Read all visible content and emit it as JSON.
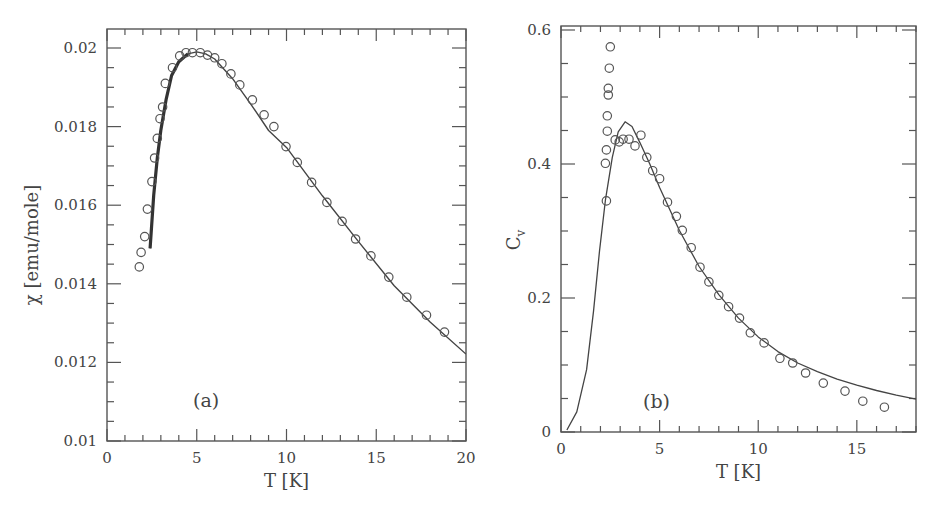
{
  "chart_data": [
    {
      "type": "scatter",
      "panel_label": "(a)",
      "xlabel": "T [K]",
      "ylabel": "χ [emu/mole]",
      "xlim": [
        0,
        20
      ],
      "ylim": [
        0.01,
        0.0205
      ],
      "xticks": [
        0,
        5,
        10,
        15,
        20
      ],
      "xtick_labels": [
        "0",
        "5",
        "10",
        "15",
        "20"
      ],
      "yticks": [
        0.01,
        0.012,
        0.014,
        0.016,
        0.018,
        0.02
      ],
      "ytick_labels": [
        "0.01",
        "0.012",
        "0.014",
        "0.016",
        "0.018",
        "0.02"
      ],
      "grid": false,
      "series": [
        {
          "name": "experiment",
          "style": "open-circle",
          "x": [
            1.8,
            1.9,
            2.1,
            2.25,
            2.5,
            2.65,
            2.8,
            2.95,
            3.1,
            3.25,
            3.65,
            4.05,
            4.4,
            4.76,
            5.2,
            5.6,
            6.0,
            6.4,
            6.9,
            7.4,
            8.1,
            8.75,
            9.3,
            9.97,
            10.6,
            11.4,
            12.25,
            13.1,
            13.85,
            14.7,
            15.7,
            16.7,
            17.8,
            18.8
          ],
          "y": [
            0.01443,
            0.0148,
            0.0152,
            0.0159,
            0.0166,
            0.0172,
            0.0177,
            0.0182,
            0.0185,
            0.0191,
            0.0195,
            0.0198,
            0.01988,
            0.01988,
            0.01988,
            0.01982,
            0.01975,
            0.0196,
            0.01934,
            0.01906,
            0.01868,
            0.0183,
            0.018,
            0.01749,
            0.01709,
            0.01658,
            0.01607,
            0.01559,
            0.01514,
            0.01471,
            0.01417,
            0.01366,
            0.0132,
            0.01277
          ]
        },
        {
          "name": "fit",
          "style": "line",
          "x": [
            2.4,
            2.6,
            2.8,
            3.0,
            3.3,
            3.6,
            4.0,
            4.5,
            5.0,
            5.5,
            6.0,
            7.0,
            8.0,
            9.0,
            10.0,
            12.0,
            14.0,
            16.0,
            18.0,
            20.0
          ],
          "y": [
            0.0149,
            0.01625,
            0.0172,
            0.0179,
            0.0187,
            0.0193,
            0.01965,
            0.01985,
            0.0199,
            0.01985,
            0.01972,
            0.01922,
            0.01858,
            0.0179,
            0.01747,
            0.01624,
            0.01508,
            0.01395,
            0.01303,
            0.01221
          ]
        }
      ]
    },
    {
      "type": "scatter",
      "panel_label": "(b)",
      "xlabel": "T [K]",
      "ylabel": "Cv",
      "ylabel_main": "C",
      "ylabel_sub": "v",
      "xlim": [
        0,
        18
      ],
      "ylim": [
        0,
        0.6
      ],
      "xticks": [
        0,
        5,
        10,
        15
      ],
      "xtick_labels": [
        "0",
        "5",
        "10",
        "15"
      ],
      "yticks": [
        0,
        0.2,
        0.4,
        0.6
      ],
      "ytick_labels": [
        "0",
        "0.2",
        "0.4",
        "0.6"
      ],
      "grid": false,
      "series": [
        {
          "name": "experiment",
          "style": "open-circle",
          "x": [
            2.5,
            2.45,
            2.4,
            2.4,
            2.35,
            2.35,
            2.3,
            2.25,
            2.3,
            2.75,
            2.95,
            3.15,
            3.45,
            3.75,
            4.05,
            4.35,
            4.65,
            5.0,
            5.4,
            5.85,
            6.15,
            6.6,
            7.05,
            7.5,
            8.0,
            8.5,
            9.05,
            9.6,
            10.3,
            11.1,
            11.75,
            12.4,
            13.3,
            14.4,
            15.3,
            16.4
          ],
          "y": [
            0.575,
            0.543,
            0.513,
            0.503,
            0.472,
            0.449,
            0.421,
            0.401,
            0.345,
            0.436,
            0.433,
            0.437,
            0.437,
            0.427,
            0.443,
            0.41,
            0.39,
            0.378,
            0.343,
            0.322,
            0.301,
            0.275,
            0.246,
            0.224,
            0.204,
            0.187,
            0.17,
            0.148,
            0.133,
            0.11,
            0.103,
            0.088,
            0.073,
            0.061,
            0.046,
            0.037
          ]
        },
        {
          "name": "fit",
          "style": "line",
          "x": [
            0.3,
            0.8,
            1.3,
            1.65,
            1.95,
            2.25,
            2.6,
            2.9,
            3.25,
            3.6,
            4.0,
            4.5,
            5.0,
            6.0,
            7.0,
            8.0,
            9.0,
            10.0,
            11.0,
            12.0,
            13.0,
            14.0,
            15.0,
            16.0,
            17.0,
            18.0
          ],
          "y": [
            0.003,
            0.03,
            0.093,
            0.18,
            0.27,
            0.346,
            0.41,
            0.448,
            0.463,
            0.456,
            0.432,
            0.4,
            0.365,
            0.301,
            0.247,
            0.205,
            0.17,
            0.142,
            0.12,
            0.103,
            0.09,
            0.079,
            0.07,
            0.062,
            0.055,
            0.049
          ]
        }
      ]
    }
  ]
}
